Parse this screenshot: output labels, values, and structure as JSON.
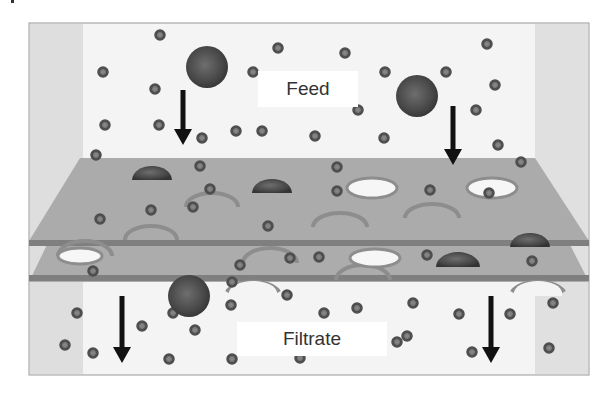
{
  "figure": {
    "labels": {
      "feed": "Feed",
      "filtrate": "Filtrate"
    },
    "colors": {
      "background": "#ffffff",
      "chamber_back": "#f2f2f2",
      "chamber_side": "#dddddd",
      "frame": "#9a9a9a",
      "membrane": "#a9a9a9",
      "membrane_edge": "#7c7c7c",
      "large_particle": "#4a4a4a",
      "small_particle": "#5a5a5a",
      "arrow": "#111111"
    },
    "components": [
      {
        "name": "feed-chamber",
        "description": "Upper compartment containing large and small particles"
      },
      {
        "name": "membrane-top",
        "description": "Upper porous membrane sheet"
      },
      {
        "name": "membrane-bottom",
        "description": "Lower porous membrane sheet"
      },
      {
        "name": "filtrate-chamber",
        "description": "Lower compartment containing only small particles"
      }
    ],
    "flow_direction": "downward",
    "arrows": [
      {
        "x": 183,
        "y1": 90,
        "y2": 145
      },
      {
        "x": 453,
        "y1": 106,
        "y2": 165
      },
      {
        "x": 122,
        "y1": 296,
        "y2": 363
      },
      {
        "x": 491,
        "y1": 296,
        "y2": 363
      }
    ],
    "large_particles_feed": [
      {
        "cx": 207,
        "cy": 67,
        "r": 21
      },
      {
        "cx": 417,
        "cy": 96,
        "r": 21
      }
    ],
    "large_particles_trapped": [
      {
        "cx": 152,
        "cy": 180,
        "rx": 20,
        "ry": 14
      },
      {
        "cx": 272,
        "cy": 193,
        "rx": 20,
        "ry": 14
      },
      {
        "cx": 458,
        "cy": 267,
        "rx": 22,
        "ry": 15
      },
      {
        "cx": 530,
        "cy": 247,
        "rx": 20,
        "ry": 14
      }
    ],
    "large_particles_passing": [
      {
        "cx": 189,
        "cy": 296,
        "r": 21
      }
    ],
    "small_particles": [
      {
        "cx": 160,
        "cy": 35
      },
      {
        "cx": 103,
        "cy": 72
      },
      {
        "cx": 155,
        "cy": 89
      },
      {
        "cx": 105,
        "cy": 125
      },
      {
        "cx": 159,
        "cy": 125
      },
      {
        "cx": 96,
        "cy": 155
      },
      {
        "cx": 202,
        "cy": 138
      },
      {
        "cx": 236,
        "cy": 131
      },
      {
        "cx": 253,
        "cy": 72
      },
      {
        "cx": 278,
        "cy": 48
      },
      {
        "cx": 262,
        "cy": 131
      },
      {
        "cx": 345,
        "cy": 53
      },
      {
        "cx": 315,
        "cy": 136
      },
      {
        "cx": 358,
        "cy": 110
      },
      {
        "cx": 385,
        "cy": 72
      },
      {
        "cx": 384,
        "cy": 138
      },
      {
        "cx": 446,
        "cy": 72
      },
      {
        "cx": 487,
        "cy": 44
      },
      {
        "cx": 495,
        "cy": 85
      },
      {
        "cx": 476,
        "cy": 110
      },
      {
        "cx": 498,
        "cy": 145
      },
      {
        "cx": 521,
        "cy": 162
      },
      {
        "cx": 337,
        "cy": 167
      },
      {
        "cx": 489,
        "cy": 193
      },
      {
        "cx": 200,
        "cy": 166
      },
      {
        "cx": 210,
        "cy": 189
      },
      {
        "cx": 151,
        "cy": 210
      },
      {
        "cx": 100,
        "cy": 219
      },
      {
        "cx": 268,
        "cy": 226
      },
      {
        "cx": 337,
        "cy": 191
      },
      {
        "cx": 430,
        "cy": 190
      },
      {
        "cx": 93,
        "cy": 271
      },
      {
        "cx": 290,
        "cy": 258
      },
      {
        "cx": 319,
        "cy": 257
      },
      {
        "cx": 427,
        "cy": 255
      },
      {
        "cx": 240,
        "cy": 265
      },
      {
        "cx": 532,
        "cy": 261
      },
      {
        "cx": 287,
        "cy": 295
      },
      {
        "cx": 77,
        "cy": 313
      },
      {
        "cx": 65,
        "cy": 345
      },
      {
        "cx": 93,
        "cy": 353
      },
      {
        "cx": 142,
        "cy": 326
      },
      {
        "cx": 173,
        "cy": 313
      },
      {
        "cx": 195,
        "cy": 330
      },
      {
        "cx": 169,
        "cy": 359
      },
      {
        "cx": 231,
        "cy": 305
      },
      {
        "cx": 232,
        "cy": 359
      },
      {
        "cx": 300,
        "cy": 358
      },
      {
        "cx": 324,
        "cy": 313
      },
      {
        "cx": 357,
        "cy": 308
      },
      {
        "cx": 413,
        "cy": 303
      },
      {
        "cx": 397,
        "cy": 342
      },
      {
        "cx": 407,
        "cy": 336
      },
      {
        "cx": 459,
        "cy": 314
      },
      {
        "cx": 472,
        "cy": 352
      },
      {
        "cx": 510,
        "cy": 314
      },
      {
        "cx": 553,
        "cy": 303
      },
      {
        "cx": 549,
        "cy": 348
      },
      {
        "cx": 232,
        "cy": 282
      },
      {
        "cx": 193,
        "cy": 207
      }
    ]
  }
}
